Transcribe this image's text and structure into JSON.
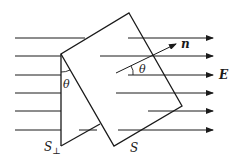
{
  "diagram": {
    "type": "electric flux through tilted surface",
    "colors": {
      "stroke": "#1a1a1a",
      "background": "#ffffff"
    },
    "field": {
      "label": "E",
      "lines": [
        {
          "y": 38,
          "segments": [
            [
              15,
              85
            ],
            [
              128,
              213
            ]
          ]
        },
        {
          "y": 56,
          "segments": [
            [
              15,
              61
            ],
            [
              100,
              213
            ]
          ]
        },
        {
          "y": 75,
          "segments": [
            [
              15,
              61
            ],
            [
              128,
              213
            ]
          ]
        },
        {
          "y": 93,
          "segments": [
            [
              15,
              61
            ],
            [
              116,
              213
            ]
          ]
        },
        {
          "y": 111,
          "segments": [
            [
              15,
              61
            ],
            [
              148,
              213
            ]
          ]
        },
        {
          "y": 130,
          "segments": [
            [
              15,
              61
            ],
            [
              118,
              213
            ]
          ]
        }
      ]
    },
    "surface_S": {
      "label": "S",
      "corners": [
        [
          129,
          13
        ],
        [
          182,
          106
        ],
        [
          114,
          146
        ],
        [
          61,
          54
        ]
      ]
    },
    "surface_perp": {
      "label": "S⊥",
      "label_main": "S",
      "label_sub": "⊥",
      "vertical": [
        [
          61,
          54
        ],
        [
          61,
          146
        ]
      ],
      "bottom": [
        [
          61,
          146
        ],
        [
          100,
          124
        ]
      ]
    },
    "normal": {
      "label": "n",
      "from": [
        116,
        73
      ],
      "to": [
        176,
        44
      ]
    },
    "angles": [
      {
        "label": "θ",
        "position": "between S⊥ and S at top-left corner"
      },
      {
        "label": "θ",
        "position": "between n and E"
      }
    ]
  }
}
